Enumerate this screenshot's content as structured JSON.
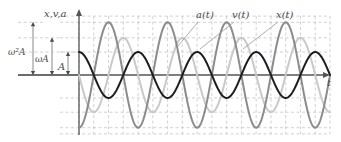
{
  "figure": {
    "name": "shm-x-v-a-versus-time",
    "axis_y_label": "x,v,a",
    "axis_x_label": "t",
    "amplitude_labels": {
      "a_amp": "ω²A",
      "v_amp": "ωA",
      "x_amp": "A"
    },
    "curve_labels": {
      "acceleration": "a(t)",
      "velocity": "v(t)",
      "displacement": "x(t)"
    },
    "colors": {
      "displacement": "#1d1d1d",
      "velocity": "#c9c9c9",
      "acceleration": "#8c8c8c",
      "axis": "#555555",
      "grid": "#b9bcd0",
      "label": "#4a4a4a"
    }
  },
  "chart_data": {
    "type": "line",
    "title": "",
    "xlabel": "t",
    "ylabel": "x,v,a",
    "grid": true,
    "legend_position": "top",
    "x_range": [
      0,
      4.25
    ],
    "y_range": [
      -1.0,
      1.0
    ],
    "x_samples": 440,
    "x_axis_pixel": {
      "x0": 79,
      "x1": 330,
      "baseline_y": 75
    },
    "series": [
      {
        "name": "x(t)",
        "label": "x(t)",
        "color": "#1d1d1d",
        "amplitude": 0.37,
        "amplitude_label": "A",
        "phase_deg": 90,
        "form": "A*cos(2*pi*f*t)",
        "stroke_width": 2.0,
        "label_pos": [
          276,
          18
        ],
        "leader_to": [
          243,
          49
        ]
      },
      {
        "name": "v(t)",
        "label": "v(t)",
        "color": "#c9c9c9",
        "amplitude": 0.6,
        "amplitude_label": "ωA",
        "phase_deg": 180,
        "form": "-ωA*sin(2*pi*f*t)",
        "stroke_width": 2.0,
        "label_pos": [
          232,
          18
        ],
        "leader_to": [
          200,
          49
        ]
      },
      {
        "name": "a(t)",
        "label": "a(t)",
        "color": "#8c8c8c",
        "amplitude": 0.85,
        "amplitude_label": "ω²A",
        "phase_deg": 270,
        "form": "-ω²A*cos(2*pi*f*t)",
        "stroke_width": 2.0,
        "label_pos": [
          196,
          18
        ],
        "leader_to": [
          178,
          46
        ]
      }
    ],
    "cycles": 4.25,
    "gridlines_y": [
      -0.85,
      -0.6,
      -0.37,
      0.37,
      0.6,
      0.85
    ],
    "gridlines_x_per_cycle": 4,
    "amplitude_markers": [
      {
        "label": "ω²A",
        "value": 0.85,
        "x_px": 33,
        "text_x": 8,
        "text_y": 55
      },
      {
        "label": "ωA",
        "value": 0.6,
        "x_px": 52,
        "text_x": 35,
        "text_y": 62
      },
      {
        "label": "A",
        "value": 0.37,
        "x_px": 68,
        "text_x": 58,
        "text_y": 70
      }
    ]
  }
}
